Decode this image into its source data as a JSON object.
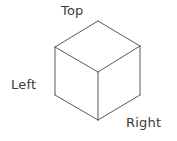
{
  "figure": {
    "name": "isometric-cube-diagram",
    "background_color": "#ffffff",
    "stroke_color": "#595959",
    "stroke_width": 1,
    "label_color": "#3b3b3b",
    "width": 177,
    "height": 141
  },
  "labels": {
    "top": "Top",
    "left": "Left",
    "right": "Right"
  },
  "cube": {
    "vertices": {
      "top_apex": [
        98,
        21
      ],
      "left_top": [
        55,
        47
      ],
      "right_top": [
        140,
        46
      ],
      "center": [
        98,
        72
      ],
      "left_bottom": [
        55,
        95
      ],
      "right_bottom": [
        140,
        95
      ],
      "bottom_apex": [
        98,
        120
      ]
    },
    "faces": [
      {
        "name": "top-face",
        "points": "98,21 55,47 98,72 140,46"
      },
      {
        "name": "left-face",
        "points": "55,47 55,95 98,120 98,72"
      },
      {
        "name": "right-face",
        "points": "140,46 140,95 98,120 98,72"
      }
    ],
    "edges": [
      {
        "name": "edge-top-to-left-top",
        "x1": 98,
        "y1": 21,
        "x2": 55,
        "y2": 47
      },
      {
        "name": "edge-top-to-right-top",
        "x1": 98,
        "y1": 21,
        "x2": 140,
        "y2": 46
      },
      {
        "name": "edge-left-top-to-center",
        "x1": 55,
        "y1": 47,
        "x2": 98,
        "y2": 72
      },
      {
        "name": "edge-right-top-to-center",
        "x1": 140,
        "y1": 46,
        "x2": 98,
        "y2": 72
      },
      {
        "name": "edge-left-vertical",
        "x1": 55,
        "y1": 47,
        "x2": 55,
        "y2": 95
      },
      {
        "name": "edge-right-vertical",
        "x1": 140,
        "y1": 46,
        "x2": 140,
        "y2": 95
      },
      {
        "name": "edge-center-vertical",
        "x1": 98,
        "y1": 72,
        "x2": 98,
        "y2": 120
      },
      {
        "name": "edge-left-bottom-to-bottom-apex",
        "x1": 55,
        "y1": 95,
        "x2": 98,
        "y2": 120
      },
      {
        "name": "edge-right-bottom-to-bottom-apex",
        "x1": 140,
        "y1": 95,
        "x2": 98,
        "y2": 120
      }
    ]
  }
}
